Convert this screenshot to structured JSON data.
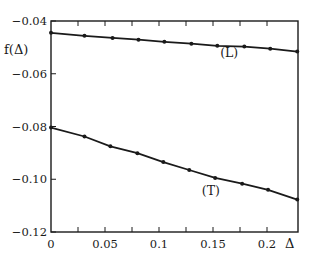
{
  "chart_data": {
    "type": "line",
    "title": "",
    "xlabel": "Δ",
    "ylabel": "f(Δ)",
    "xlim": [
      0,
      0.229
    ],
    "ylim": [
      -0.12,
      -0.04
    ],
    "x_ticks": [
      0,
      0.05,
      0.1,
      0.15,
      0.2
    ],
    "x_tick_labels": [
      "0",
      "0.05",
      "0.1",
      "0.15",
      "0.2"
    ],
    "x_minor_ticks": [
      0.025,
      0.075,
      0.125,
      0.175
    ],
    "y_ticks": [
      -0.04,
      -0.06,
      -0.08,
      -0.1,
      -0.12
    ],
    "y_tick_labels": [
      "−0.04",
      "−0.06",
      "−0.08",
      "−0.10",
      "−0.12"
    ],
    "grid": false,
    "legend": "inline labels",
    "series": [
      {
        "name": "(L)",
        "x": [
          0,
          0.031,
          0.057,
          0.081,
          0.105,
          0.13,
          0.154,
          0.179,
          0.203,
          0.228
        ],
        "values": [
          -0.0445,
          -0.0456,
          -0.0464,
          -0.0471,
          -0.0479,
          -0.0486,
          -0.0494,
          -0.0497,
          -0.0505,
          -0.0516
        ],
        "label_pos": [
          0.165,
          -0.0535
        ]
      },
      {
        "name": "(T)",
        "x": [
          0,
          0.031,
          0.055,
          0.08,
          0.104,
          0.128,
          0.152,
          0.177,
          0.201,
          0.228
        ],
        "values": [
          -0.0804,
          -0.0838,
          -0.0875,
          -0.0901,
          -0.0935,
          -0.0965,
          -0.0995,
          -0.1017,
          -0.104,
          -0.1077
        ],
        "label_pos": [
          0.148,
          -0.1058
        ]
      }
    ]
  },
  "labels": {
    "ylabel": "f(Δ)",
    "xlabel": "Δ"
  }
}
